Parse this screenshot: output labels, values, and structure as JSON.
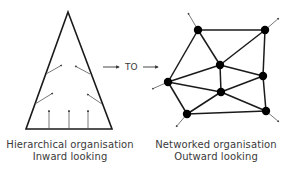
{
  "colors": {
    "stroke": "#1a1a1a",
    "thin_arrow": "#555555",
    "text": "#3a3a3a",
    "background": "#ffffff"
  },
  "transition": {
    "label": "TO",
    "arrows": [
      {
        "x1": 103,
        "y1": 67,
        "x2": 119,
        "y2": 67
      },
      {
        "x1": 143,
        "y1": 67,
        "x2": 158,
        "y2": 67
      }
    ]
  },
  "hierarchy": {
    "shape": "triangle",
    "triangle": {
      "apex": [
        68,
        12
      ],
      "base_left": [
        26,
        129
      ],
      "base_right": [
        112,
        129
      ]
    },
    "inward_arrows": [
      {
        "x1": 46,
        "y1": 74,
        "x2": 62,
        "y2": 65
      },
      {
        "x1": 90,
        "y1": 74,
        "x2": 75,
        "y2": 66
      },
      {
        "x1": 35,
        "y1": 104,
        "x2": 53,
        "y2": 93
      },
      {
        "x1": 102,
        "y1": 104,
        "x2": 87,
        "y2": 94
      },
      {
        "x1": 49,
        "y1": 129,
        "x2": 49,
        "y2": 110
      },
      {
        "x1": 69,
        "y1": 129,
        "x2": 69,
        "y2": 110
      },
      {
        "x1": 88,
        "y1": 129,
        "x2": 88,
        "y2": 110
      }
    ],
    "caption": {
      "line1": "Hierarchical organisation",
      "line2": "Inward looking"
    }
  },
  "network": {
    "nodes": [
      {
        "id": "A",
        "x": 198,
        "y": 30
      },
      {
        "id": "B",
        "x": 265,
        "y": 30
      },
      {
        "id": "C",
        "x": 220,
        "y": 65
      },
      {
        "id": "D",
        "x": 168,
        "y": 82
      },
      {
        "id": "E",
        "x": 263,
        "y": 76
      },
      {
        "id": "F",
        "x": 221,
        "y": 92
      },
      {
        "id": "G",
        "x": 187,
        "y": 114
      },
      {
        "id": "H",
        "x": 266,
        "y": 111
      }
    ],
    "edges": [
      [
        "A",
        "B"
      ],
      [
        "A",
        "C"
      ],
      [
        "A",
        "D"
      ],
      [
        "B",
        "C"
      ],
      [
        "B",
        "E"
      ],
      [
        "C",
        "E"
      ],
      [
        "C",
        "F"
      ],
      [
        "C",
        "D"
      ],
      [
        "D",
        "F"
      ],
      [
        "D",
        "G"
      ],
      [
        "F",
        "E"
      ],
      [
        "F",
        "G"
      ],
      [
        "F",
        "H"
      ],
      [
        "E",
        "H"
      ],
      [
        "G",
        "H"
      ]
    ],
    "outward_arrows": [
      {
        "from": "A",
        "x2": 188,
        "y2": 13
      },
      {
        "from": "B",
        "x2": 279,
        "y2": 18
      },
      {
        "from": "D",
        "x2": 152,
        "y2": 89
      },
      {
        "from": "G",
        "x2": 176,
        "y2": 127
      },
      {
        "from": "H",
        "x2": 279,
        "y2": 122
      }
    ],
    "node_radius": 4.2,
    "caption": {
      "line1": "Networked organisation",
      "line2": "Outward looking"
    }
  }
}
